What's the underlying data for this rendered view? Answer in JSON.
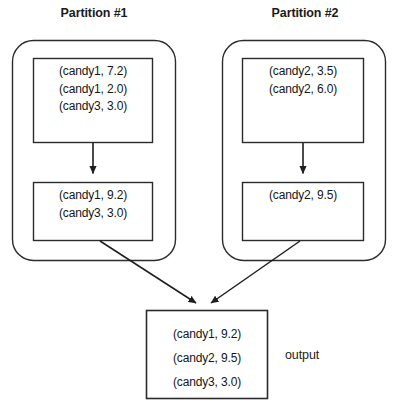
{
  "diagram": {
    "type": "flow-diagram",
    "partitions": [
      {
        "title": "Partition #1",
        "input_box": {
          "lines": [
            "(candy1, 7.2)",
            "(candy1, 2.0)",
            "(candy3, 3.0)"
          ]
        },
        "result_box": {
          "lines": [
            "(candy1, 9.2)",
            "(candy3, 3.0)"
          ]
        }
      },
      {
        "title": "Partition #2",
        "input_box": {
          "lines": [
            "(candy2, 3.5)",
            "(candy2, 6.0)"
          ]
        },
        "result_box": {
          "lines": [
            "(candy2, 9.5)"
          ]
        }
      }
    ],
    "output": {
      "label": "output",
      "lines": [
        "(candy1, 9.2)",
        "(candy2, 9.5)",
        "(candy3, 3.0)"
      ]
    },
    "colors": {
      "stroke": "#2b2b2b",
      "text": "#151515",
      "background": "#ffffff"
    }
  }
}
